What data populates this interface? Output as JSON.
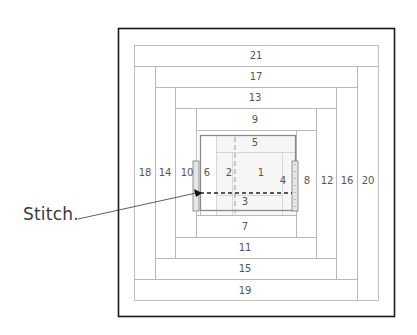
{
  "diagram": {
    "type": "log-cabin-quilt-block-piecing-order",
    "callout": {
      "label": "Stitch."
    },
    "strips": [
      {
        "n": "1",
        "label": "1",
        "x": 232,
        "y": 152,
        "w": 50,
        "h": 43,
        "lx": 261,
        "ly": 176
      },
      {
        "n": "2",
        "label": "2",
        "x": 216,
        "y": 152,
        "w": 16,
        "h": 63,
        "lx": 229,
        "ly": 176
      },
      {
        "n": "3",
        "label": "3",
        "x": 216,
        "y": 195,
        "w": 66,
        "h": 20,
        "lx": 245,
        "ly": 205
      },
      {
        "n": "4",
        "label": "4",
        "x": 282,
        "y": 152,
        "w": 14,
        "h": 63,
        "lx": 283,
        "ly": 184
      },
      {
        "n": "5",
        "label": "5",
        "x": 216,
        "y": 135,
        "w": 80,
        "h": 17,
        "lx": 255,
        "ly": 146
      },
      {
        "n": "6",
        "label": "6",
        "x": 200,
        "y": 135,
        "w": 16,
        "h": 80,
        "lx": 207,
        "ly": 176
      },
      {
        "n": "7",
        "label": "7",
        "x": 196,
        "y": 215,
        "w": 100,
        "h": 22,
        "lx": 245,
        "ly": 230
      },
      {
        "n": "8",
        "label": "8",
        "x": 296,
        "y": 130,
        "w": 20,
        "h": 107,
        "lx": 307,
        "ly": 184
      },
      {
        "n": "9",
        "label": "9",
        "x": 196,
        "y": 108,
        "w": 120,
        "h": 22,
        "lx": 255,
        "ly": 123
      },
      {
        "n": "10",
        "label": "10",
        "x": 175,
        "y": 108,
        "w": 21,
        "h": 129,
        "lx": 187,
        "ly": 176
      },
      {
        "n": "11",
        "label": "11",
        "x": 175,
        "y": 237,
        "w": 141,
        "h": 21,
        "lx": 245,
        "ly": 251
      },
      {
        "n": "12",
        "label": "12",
        "x": 316,
        "y": 108,
        "w": 20,
        "h": 150,
        "lx": 327,
        "ly": 184
      },
      {
        "n": "13",
        "label": "13",
        "x": 175,
        "y": 87,
        "w": 161,
        "h": 21,
        "lx": 255,
        "ly": 101
      },
      {
        "n": "14",
        "label": "14",
        "x": 155,
        "y": 87,
        "w": 20,
        "h": 171,
        "lx": 165,
        "ly": 176
      },
      {
        "n": "15",
        "label": "15",
        "x": 155,
        "y": 258,
        "w": 181,
        "h": 21,
        "lx": 245,
        "ly": 272
      },
      {
        "n": "16",
        "label": "16",
        "x": 336,
        "y": 87,
        "w": 21,
        "h": 192,
        "lx": 347,
        "ly": 184
      },
      {
        "n": "17",
        "label": "17",
        "x": 155,
        "y": 66,
        "w": 202,
        "h": 21,
        "lx": 256,
        "ly": 80
      },
      {
        "n": "18",
        "label": "18",
        "x": 134,
        "y": 66,
        "w": 21,
        "h": 213,
        "lx": 145,
        "ly": 176
      },
      {
        "n": "19",
        "label": "19",
        "x": 134,
        "y": 279,
        "w": 223,
        "h": 21,
        "lx": 245,
        "ly": 294
      },
      {
        "n": "20",
        "label": "20",
        "x": 357,
        "y": 66,
        "w": 21,
        "h": 234,
        "lx": 368,
        "ly": 184
      },
      {
        "n": "21",
        "label": "21",
        "x": 134,
        "y": 45,
        "w": 244,
        "h": 21,
        "lx": 256,
        "ly": 59
      }
    ],
    "colors": {
      "frame": "#1a1a1a",
      "strip_line": "#b8b8b8",
      "center_fill": "#f1f1f1",
      "grey_outline": "#8a8a8a",
      "stitch_line": "#222222",
      "label_text": "#555555"
    }
  }
}
